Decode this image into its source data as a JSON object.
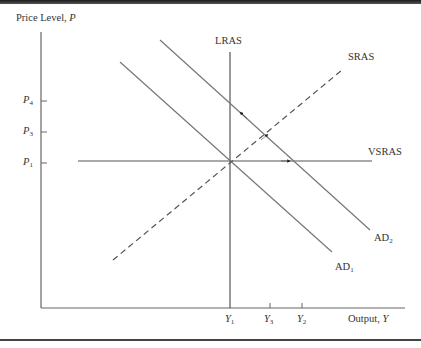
{
  "diagram": {
    "title": "",
    "y_axis_label": "Price Level,",
    "y_axis_var": "P",
    "x_axis_label": "Output,",
    "x_axis_var": "Y",
    "price_ticks": [
      {
        "base": "P",
        "sub": "4"
      },
      {
        "base": "P",
        "sub": "3"
      },
      {
        "base": "P",
        "sub": "1"
      }
    ],
    "output_ticks": [
      {
        "base": "Y",
        "sub": "1"
      },
      {
        "base": "Y",
        "sub": "3"
      },
      {
        "base": "Y",
        "sub": "2"
      }
    ],
    "curves": {
      "lras": "LRAS",
      "sras": "SRAS",
      "vsras": "VSRAS",
      "ad1_base": "AD",
      "ad1_sub": "1",
      "ad2_base": "AD",
      "ad2_sub": "2"
    },
    "colors": {
      "line": "#555555",
      "axis": "#666666",
      "frame": "#444444"
    }
  }
}
